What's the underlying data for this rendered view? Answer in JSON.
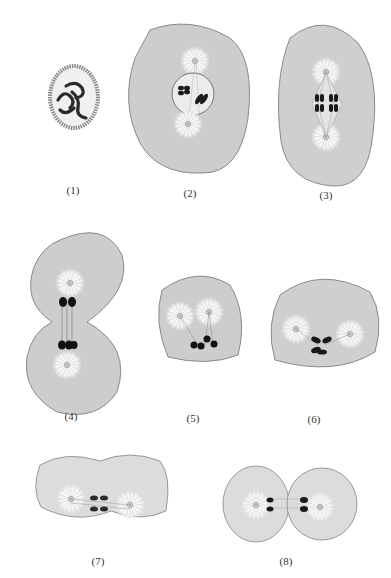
{
  "figure": {
    "panels": [
      {
        "id": 1,
        "label": "(1)",
        "stage": "prophase-nucleus",
        "x": 73,
        "y": 192
      },
      {
        "id": 2,
        "label": "(2)",
        "stage": "prometaphase",
        "x": 190,
        "y": 195
      },
      {
        "id": 3,
        "label": "(3)",
        "stage": "metaphase",
        "x": 326,
        "y": 197
      },
      {
        "id": 4,
        "label": "(4)",
        "stage": "late-anaphase",
        "x": 71,
        "y": 417
      },
      {
        "id": 5,
        "label": "(5)",
        "stage": "anaphase-oblique",
        "x": 193,
        "y": 419
      },
      {
        "id": 6,
        "label": "(6)",
        "stage": "metaphase-side",
        "x": 314,
        "y": 421
      },
      {
        "id": 7,
        "label": "(7)",
        "stage": "telophase-pinching",
        "x": 98,
        "y": 563
      },
      {
        "id": 8,
        "label": "(8)",
        "stage": "cytokinesis",
        "x": 286,
        "y": 563
      }
    ],
    "colors": {
      "cytoplasm": "#cfcfcf",
      "cytoplasm_light": "#e2e2e2",
      "aster": "#f6f6f6",
      "chromosome": "#1a1a1a",
      "outline": "#8a8a8a"
    }
  }
}
